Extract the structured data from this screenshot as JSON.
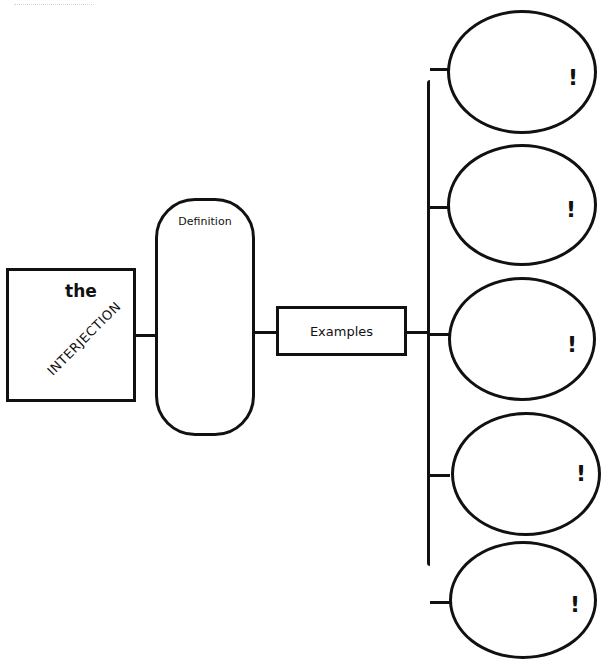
{
  "diagram": {
    "title": {
      "line1": "the",
      "line2": "INTERJECTION"
    },
    "definition": {
      "label": "Definition"
    },
    "examples": {
      "label": "Examples"
    },
    "example_ovals": [
      {
        "mark": "!"
      },
      {
        "mark": "!"
      },
      {
        "mark": "!"
      },
      {
        "mark": "!"
      },
      {
        "mark": "!"
      }
    ]
  }
}
